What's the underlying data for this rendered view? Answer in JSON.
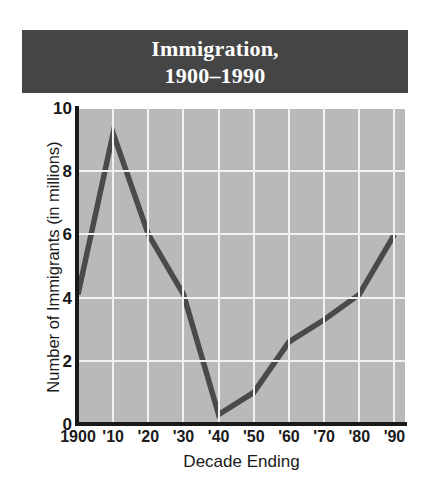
{
  "title": {
    "line1": "Immigration,",
    "line2": "1900–1990",
    "bar_color": "#454545",
    "text_color": "#ffffff"
  },
  "chart_data": {
    "type": "line",
    "title": "Immigration, 1900–1990",
    "xlabel": "Decade Ending",
    "ylabel": "Number of Immigrants (in millions)",
    "categories": [
      "1900",
      "'10",
      "'20",
      "'30",
      "'40",
      "'50",
      "'60",
      "'70",
      "'80",
      "'90"
    ],
    "values": [
      4.1,
      9.2,
      6.0,
      4.1,
      0.3,
      1.0,
      2.6,
      3.3,
      4.1,
      6.0
    ],
    "x_tick_labels": [
      "1900",
      "'10",
      "'20",
      "'30",
      "'40",
      "'50",
      "'60",
      "'70",
      "'80",
      "'90"
    ],
    "y_tick_labels": [
      "0",
      "2",
      "4",
      "6",
      "8",
      "10"
    ],
    "y_ticks": [
      0,
      2,
      4,
      6,
      8,
      10
    ],
    "ylim": [
      0,
      10
    ],
    "grid": true,
    "grid_color": "#f2f2f2",
    "plot_background": "#b9b9b9",
    "line_color": "#4a4a4a",
    "axis_color": "#1a1a1a",
    "legend": "none"
  }
}
